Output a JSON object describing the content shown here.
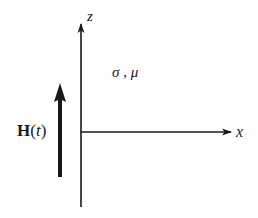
{
  "diagram": {
    "type": "coordinate-axes-with-field",
    "axes": {
      "z": {
        "label": "z",
        "origin": [
          81,
          132
        ],
        "tip": [
          81,
          22
        ],
        "bottom": [
          81,
          207
        ]
      },
      "x": {
        "label": "x",
        "origin": [
          81,
          132
        ],
        "tip": [
          231,
          132
        ]
      }
    },
    "medium": {
      "label": "σ , μ",
      "sigma": "σ",
      "separator": " , ",
      "mu": "μ"
    },
    "field": {
      "symbol": "H",
      "open_paren": "(",
      "argument": "t",
      "close_paren": ")",
      "arrow_direction": "up",
      "arrow_x": 60,
      "arrow_top": 84,
      "arrow_bottom": 177
    },
    "colors": {
      "ink": "#1a1a1a",
      "background": "#ffffff"
    }
  }
}
